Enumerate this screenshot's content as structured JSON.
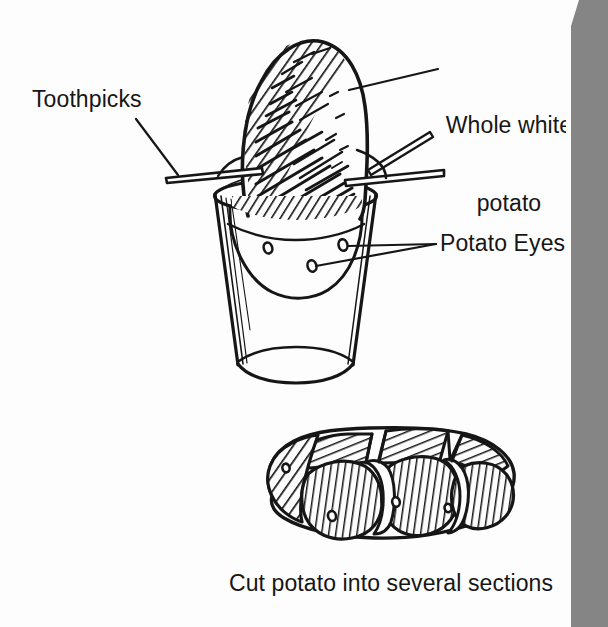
{
  "figure": {
    "kind": "line-drawing-illustration",
    "background_color": "#fdfdfd",
    "ink_color": "#161616",
    "page_edge_shadow_color": "#858585"
  },
  "labels": {
    "toothpicks": "Toothpicks",
    "whole_white_potato": "Whole white\npotato",
    "whole_white_potato_line1": "Whole white",
    "whole_white_potato_line2": "potato",
    "potato_eyes": "Potato Eyes"
  },
  "caption": {
    "cut_potato": "Cut potato into several sections"
  },
  "drawing_parts": {
    "glass": "drinking-glass",
    "potato": "whole-white-potato",
    "toothpick_left": "toothpick",
    "toothpick_right": "toothpick",
    "eyes_count": 3,
    "cut_sections_count": 5
  }
}
